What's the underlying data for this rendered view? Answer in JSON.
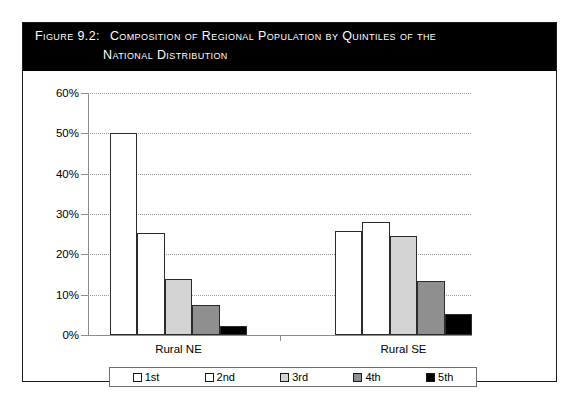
{
  "figure": {
    "label": "Figure 9.2:",
    "title_line_1": "Composition of Regional Population by Quintiles of the",
    "title_line_2": "National Distribution"
  },
  "legend": {
    "items": [
      {
        "label": "1st",
        "color": "#ffffff",
        "swatch_name": "legend-swatch-1st"
      },
      {
        "label": "2nd",
        "color": "#ffffff",
        "swatch_name": "legend-swatch-2nd"
      },
      {
        "label": "3rd",
        "color": "#d4d4d4",
        "swatch_name": "legend-swatch-3rd"
      },
      {
        "label": "4th",
        "color": "#8f8f8f",
        "swatch_name": "legend-swatch-4th"
      },
      {
        "label": "5th",
        "color": "#000000",
        "swatch_name": "legend-swatch-5th"
      }
    ]
  },
  "axis": {
    "y_ticks": [
      "0%",
      "10%",
      "20%",
      "30%",
      "40%",
      "50%",
      "60%"
    ],
    "x_categories": [
      "Rural NE",
      "Rural SE"
    ]
  },
  "chart_data": {
    "type": "bar",
    "title": "Composition of Regional Population by Quintiles of the National Distribution",
    "xlabel": "",
    "ylabel": "",
    "ylim": [
      0,
      60
    ],
    "ytick_values": [
      0,
      10,
      20,
      30,
      40,
      50,
      60
    ],
    "ytick_labels": [
      "0%",
      "10%",
      "20%",
      "30%",
      "40%",
      "50%",
      "60%"
    ],
    "grid": true,
    "grid_axis": "y",
    "legend_position": "bottom",
    "categories": [
      "Rural NE",
      "Rural SE"
    ],
    "series": [
      {
        "name": "1st",
        "color": "#ffffff",
        "values": [
          50.2,
          25.8
        ]
      },
      {
        "name": "2nd",
        "color": "#ffffff",
        "values": [
          25.2,
          28.0
        ]
      },
      {
        "name": "3rd",
        "color": "#d4d4d4",
        "values": [
          13.9,
          24.6
        ]
      },
      {
        "name": "4th",
        "color": "#8f8f8f",
        "values": [
          7.5,
          13.4
        ]
      },
      {
        "name": "5th",
        "color": "#000000",
        "values": [
          2.3,
          5.3
        ]
      }
    ],
    "units": "percent"
  }
}
